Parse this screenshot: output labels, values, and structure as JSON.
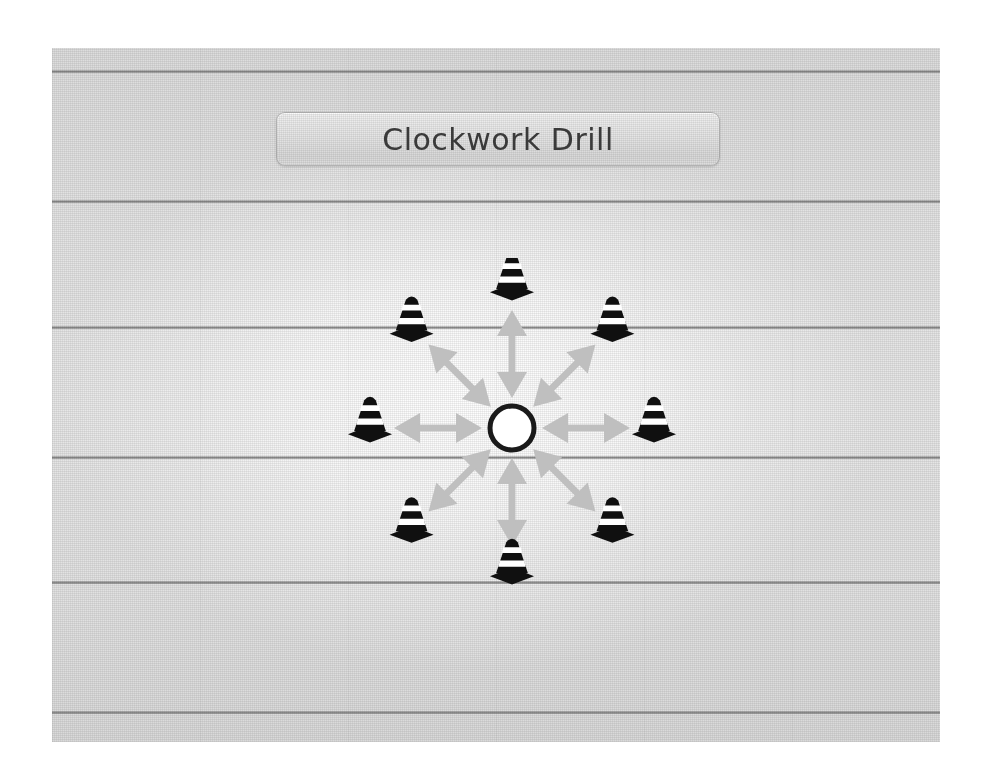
{
  "slide": {
    "title": "Clockwork Drill",
    "background": {
      "base_color": "#e3e3e3",
      "line_color": "#767676",
      "glow_color": "#ffffff",
      "line_count": 6,
      "line_positions_px": [
        22,
        152,
        278,
        408,
        533,
        663
      ]
    }
  },
  "title_plaque": {
    "label": "Clockwork Drill",
    "fill_color": "#e5e5e5",
    "border_color": "#808080",
    "text_color": "#3a3a3a"
  },
  "diagram": {
    "name": "clockwork-drill",
    "type": "radial-drill",
    "center": {
      "label": "start-position",
      "shape": "circle",
      "radius_px": 22,
      "fill_color": "#ffffff",
      "stroke_color": "#1a1a1a",
      "stroke_width_px": 5,
      "cx": 170,
      "cy": 170
    },
    "arrow": {
      "color": "#bfbfbf",
      "heads": "double",
      "count": 8,
      "inner_radius_px": 30,
      "outer_radius_px": 118
    },
    "cone": {
      "count": 8,
      "body_color": "#101010",
      "stripe_color": "#ffffff",
      "radius_px": 142,
      "width_px": 44,
      "height_px": 48
    },
    "stations": [
      {
        "index": 1,
        "clock_position": "12",
        "angle_deg": 270,
        "label": "cone-n"
      },
      {
        "index": 2,
        "clock_position": "1:30",
        "angle_deg": 315,
        "label": "cone-ne"
      },
      {
        "index": 3,
        "clock_position": "3",
        "angle_deg": 0,
        "label": "cone-e"
      },
      {
        "index": 4,
        "clock_position": "4:30",
        "angle_deg": 45,
        "label": "cone-se"
      },
      {
        "index": 5,
        "clock_position": "6",
        "angle_deg": 90,
        "label": "cone-s"
      },
      {
        "index": 6,
        "clock_position": "7:30",
        "angle_deg": 135,
        "label": "cone-sw"
      },
      {
        "index": 7,
        "clock_position": "9",
        "angle_deg": 180,
        "label": "cone-w"
      },
      {
        "index": 8,
        "clock_position": "10:30",
        "angle_deg": 225,
        "label": "cone-nw"
      }
    ]
  }
}
